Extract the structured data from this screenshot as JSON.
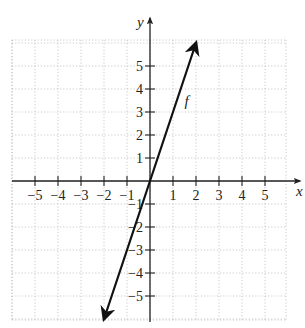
{
  "chart_data": {
    "type": "line",
    "title": "",
    "xlabel": "x",
    "ylabel": "y",
    "xlim": [
      -6,
      6
    ],
    "ylim": [
      -6,
      6
    ],
    "grid": true,
    "grid_style": "dotted",
    "x_ticks": [
      -5,
      -4,
      -3,
      -2,
      -1,
      1,
      2,
      3,
      4,
      5
    ],
    "y_ticks": [
      -5,
      -4,
      -3,
      -2,
      -1,
      1,
      2,
      3,
      4,
      5
    ],
    "x_tick_labels": [
      "−5",
      "−4",
      "−3",
      "−2",
      "−1",
      "1",
      "2",
      "3",
      "4",
      "5"
    ],
    "y_tick_labels": [
      "−5",
      "−4",
      "−3",
      "−2",
      "−1",
      "1",
      "2",
      "3",
      "4",
      "5"
    ],
    "series": [
      {
        "name": "f",
        "equation": "y = 3x",
        "x": [
          -2,
          2
        ],
        "y": [
          -6,
          6
        ],
        "arrows": "both",
        "color": "#111111"
      }
    ],
    "annotations": [
      {
        "text": "f",
        "x": 1.5,
        "y": 3.6
      }
    ]
  },
  "labels": {
    "x_axis": "x",
    "y_axis": "y",
    "curve": "f"
  }
}
